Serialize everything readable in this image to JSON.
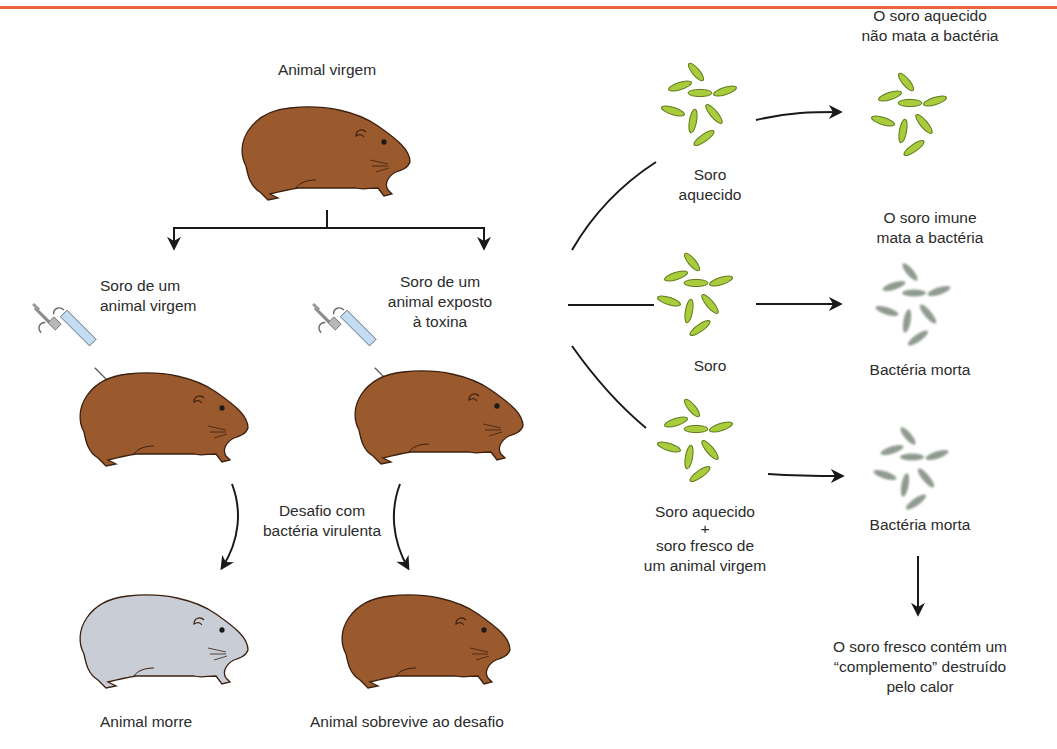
{
  "header": {
    "rule_color": "#e8643c"
  },
  "colors": {
    "guinea_pig_alive": "#9a5a2e",
    "guinea_pig_dead": "#c9cdd6",
    "bacteria_live": "#a8cc3c",
    "bacteria_outline": "#5f7a1c",
    "bacteria_dead": "#7d8a7d",
    "syringe_barrel": "#c4dcf2",
    "arrow": "#1a1a1a"
  },
  "left_panel": {
    "top_animal_label": "Animal virgem",
    "naive_serum_label": [
      "Soro de um",
      "animal virgem"
    ],
    "immune_serum_label": [
      "Soro de um",
      "animal exposto",
      "à toxina"
    ],
    "challenge_label": [
      "Desafio com",
      "bactéria virulenta"
    ],
    "outcome_dies": "Animal morre",
    "outcome_survives": "Animal sobrevive ao desafio"
  },
  "right_panel": {
    "rows": [
      {
        "input_label": [
          "Soro",
          "aquecido"
        ],
        "result_title": [
          "O soro aquecido",
          "não mata a bactéria"
        ],
        "result_label": "",
        "bacteria_state": "alive"
      },
      {
        "input_label": [
          "Soro"
        ],
        "result_title": [
          "O soro imune",
          "mata a bactéria"
        ],
        "result_label": "Bactéria morta",
        "bacteria_state": "dead"
      },
      {
        "input_label": [
          "Soro aquecido",
          "+",
          "soro fresco de",
          "um animal virgem"
        ],
        "result_title": [],
        "result_label": "Bactéria morta",
        "bacteria_state": "dead"
      }
    ],
    "conclusion": [
      "O soro fresco contém um",
      "“complemento” destruído",
      "pelo calor"
    ]
  }
}
